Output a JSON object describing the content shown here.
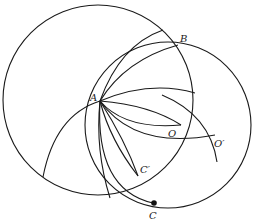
{
  "diagram": {
    "stroke_color": "#1a1a1a",
    "background": "#ffffff",
    "circles": [
      {
        "name": "large-circle",
        "cx": 98,
        "cy": 100,
        "r": 95
      },
      {
        "name": "circle-through-c",
        "cx": 168,
        "cy": 125,
        "r": 83
      }
    ],
    "arcs": [
      {
        "name": "arc-a-to-top",
        "d": "M100 101 Q 120 45 163 30"
      },
      {
        "name": "arc-a-to-b",
        "d": "M100 101 Q 125 60 178 45"
      },
      {
        "name": "arc-a-to-right",
        "d": "M100 101 Q 150 80 195 93"
      },
      {
        "name": "arc-a-to-o",
        "d": "M100 101 Q 150 105 181 125"
      },
      {
        "name": "arc-a-o-lower",
        "d": "M100 101 Q 125 130 181 125"
      },
      {
        "name": "arc-a-to-oprime",
        "d": "M100 101 Q 135 150 215 135"
      },
      {
        "name": "arc-a-to-cprime-1",
        "d": "M100 101 Q 125 140 138 176"
      },
      {
        "name": "arc-a-to-cprime-2",
        "d": "M100 101 Q 110 140 138 176"
      },
      {
        "name": "arc-a-down-1",
        "d": "M100 101 Q 95 150 110 198"
      },
      {
        "name": "arc-a-to-c",
        "d": "M100 101 Q 95 190 153 203"
      },
      {
        "name": "arc-a-left-down",
        "d": "M100 101 Q 55 115 43 177"
      },
      {
        "name": "arc-oprime-vertical",
        "d": "M162 95 Q 210 115 217 162"
      }
    ],
    "points": [
      {
        "name": "point-c",
        "x": 154,
        "y": 203,
        "r": 2.8
      }
    ],
    "labels": [
      {
        "name": "label-a",
        "text": "A",
        "x": 90,
        "y": 101
      },
      {
        "name": "label-b",
        "text": "B",
        "x": 180,
        "y": 42
      },
      {
        "name": "label-o",
        "text": "O",
        "x": 168,
        "y": 137
      },
      {
        "name": "label-o-prime",
        "text": "O′",
        "x": 214,
        "y": 147
      },
      {
        "name": "label-c-prime",
        "text": "C′",
        "x": 140,
        "y": 173
      },
      {
        "name": "label-c",
        "text": "C",
        "x": 149,
        "y": 219
      }
    ]
  }
}
